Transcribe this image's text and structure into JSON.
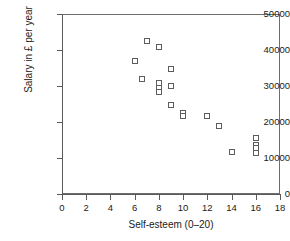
{
  "chart_data": {
    "type": "scatter",
    "title": "",
    "xlabel": "Self-esteem (0–20)",
    "ylabel": "Salary in £ per year",
    "xlim": [
      0,
      18
    ],
    "ylim": [
      0,
      50000
    ],
    "xticks": [
      0,
      2,
      4,
      6,
      8,
      10,
      12,
      14,
      16,
      18
    ],
    "xtick_labels": [
      "0",
      "2",
      "4",
      "6",
      "8",
      "10",
      "12",
      "14",
      "16",
      "18"
    ],
    "yticks": [
      0,
      10000,
      20000,
      30000,
      40000,
      50000
    ],
    "ytick_labels": [
      "0",
      "10000",
      "20000",
      "30000",
      "40000",
      "50000"
    ],
    "grid": false,
    "legend": false,
    "marker": "open-square",
    "marker_color": "#5d5d5d",
    "points": [
      {
        "x": 6,
        "y": 37000
      },
      {
        "x": 6.6,
        "y": 32000
      },
      {
        "x": 7,
        "y": 42500
      },
      {
        "x": 8,
        "y": 40800
      },
      {
        "x": 8,
        "y": 30700
      },
      {
        "x": 8,
        "y": 29500
      },
      {
        "x": 8,
        "y": 28400
      },
      {
        "x": 9,
        "y": 34800
      },
      {
        "x": 9,
        "y": 29900
      },
      {
        "x": 9,
        "y": 24800
      },
      {
        "x": 10,
        "y": 22600
      },
      {
        "x": 10,
        "y": 21800
      },
      {
        "x": 12,
        "y": 21600
      },
      {
        "x": 13,
        "y": 18800
      },
      {
        "x": 14,
        "y": 11600
      },
      {
        "x": 16,
        "y": 15500
      },
      {
        "x": 16,
        "y": 13600
      },
      {
        "x": 16,
        "y": 12700
      },
      {
        "x": 16,
        "y": 11500
      }
    ]
  },
  "figure": {
    "axis_color": "#5a5a5a",
    "text_color": "#1a1a1a",
    "background": "#ffffff"
  }
}
